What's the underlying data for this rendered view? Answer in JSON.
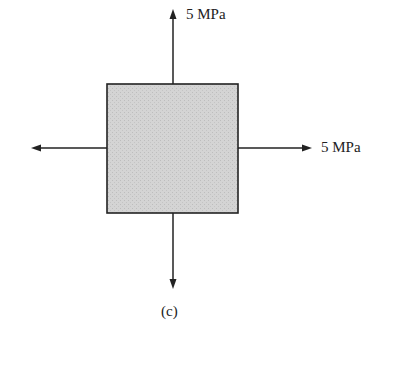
{
  "diagram": {
    "top_label": "5 MPa",
    "right_label": "5 MPa",
    "caption": "(c)",
    "element_fill": "#cfcfcf",
    "stroke_color": "#222222"
  }
}
